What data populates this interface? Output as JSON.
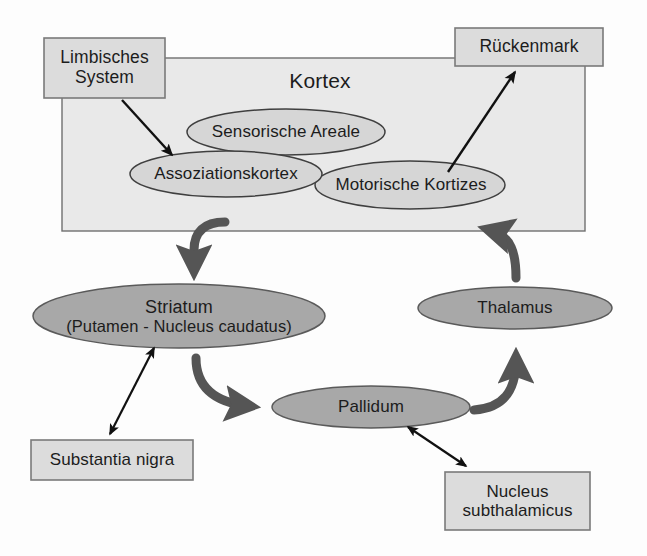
{
  "diagram": {
    "colors": {
      "page_background": "#fdfdfd",
      "cortex_fill": "#e9e9e9",
      "cortex_stroke": "#6f6f6f",
      "box_fill": "#dcdcdc",
      "box_stroke": "#7a7a7a",
      "ellipse_light_fill": "#d6d6d6",
      "ellipse_light_stroke": "#4a4a4a",
      "ellipse_dark_fill": "#a8a8a8",
      "ellipse_dark_stroke": "#5a5a5a",
      "thin_arrow": "#111111",
      "thick_arrow": "#555555",
      "text": "#1c1c1c"
    },
    "cortex_region": {
      "label": "Kortex"
    },
    "boxes": [
      {
        "id": "limbisches-system",
        "lines": [
          "Limbisches",
          "System"
        ]
      },
      {
        "id": "rueckenmark",
        "lines": [
          "Rückenmark"
        ]
      },
      {
        "id": "substantia-nigra",
        "lines": [
          "Substantia nigra"
        ]
      },
      {
        "id": "nucleus-subthalamicus",
        "lines": [
          "Nucleus",
          "subthalamicus"
        ]
      }
    ],
    "ellipses": [
      {
        "id": "sensorische-areale",
        "lines": [
          "Sensorische Areale"
        ]
      },
      {
        "id": "assoziationskortex",
        "lines": [
          "Assoziationskortex"
        ]
      },
      {
        "id": "motorische-kortizes",
        "lines": [
          "Motorische Kortizes"
        ]
      },
      {
        "id": "striatum",
        "lines": [
          "Striatum",
          "(Putamen - Nucleus caudatus)"
        ]
      },
      {
        "id": "thalamus",
        "lines": [
          "Thalamus"
        ]
      },
      {
        "id": "pallidum",
        "lines": [
          "Pallidum"
        ]
      }
    ],
    "connections": [
      {
        "id": "limbisches-to-assoziationskortex",
        "from": "Limbisches System",
        "to": "Assoziationskortex",
        "style": "thin",
        "direction": "one-way"
      },
      {
        "id": "motorische-to-rueckenmark",
        "from": "Motorische Kortizes",
        "to": "Rückenmark",
        "style": "thin",
        "direction": "one-way"
      },
      {
        "id": "kortex-to-striatum",
        "from": "Kortex",
        "to": "Striatum",
        "style": "thick",
        "direction": "one-way"
      },
      {
        "id": "striatum-to-pallidum",
        "from": "Striatum",
        "to": "Pallidum",
        "style": "thick",
        "direction": "one-way"
      },
      {
        "id": "pallidum-to-thalamus",
        "from": "Pallidum",
        "to": "Thalamus",
        "style": "thick",
        "direction": "one-way"
      },
      {
        "id": "thalamus-to-kortex",
        "from": "Thalamus",
        "to": "Kortex",
        "style": "thick",
        "direction": "one-way"
      },
      {
        "id": "striatum-substantia-nigra",
        "from": "Striatum",
        "to": "Substantia nigra",
        "style": "thin",
        "direction": "two-way"
      },
      {
        "id": "pallidum-nucleus-subthalamicus",
        "from": "Pallidum",
        "to": "Nucleus subthalamicus",
        "style": "thin",
        "direction": "two-way"
      }
    ]
  }
}
